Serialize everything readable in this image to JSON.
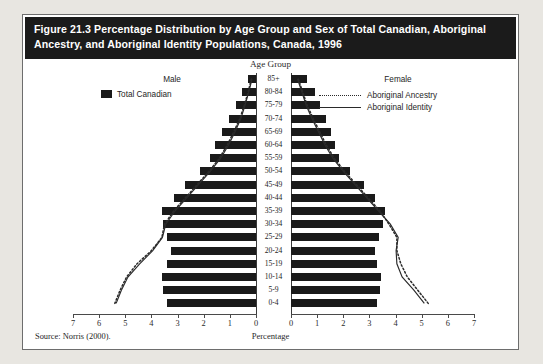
{
  "figure": {
    "title": "Figure 21.3 Percentage Distribution by Age Group and Sex of Total Canadian, Aboriginal Ancestry, and Aboriginal Identity Populations, Canada, 1996",
    "source": "Source: Norris (2000)."
  },
  "legend": {
    "male_header": "Male",
    "female_header": "Female",
    "total_canadian": "Total Canadian",
    "aboriginal_ancestry": "Aboriginal Ancestry",
    "aboriginal_identity": "Aboriginal Identity"
  },
  "axes": {
    "age_group_title": "Age Group",
    "percentage_title": "Percentage",
    "left_ticks": [
      "7",
      "6",
      "5",
      "4",
      "3",
      "2",
      "1",
      "0"
    ],
    "right_ticks": [
      "0",
      "1",
      "2",
      "3",
      "4",
      "5",
      "6",
      "7"
    ]
  },
  "colors": {
    "bar": "#1a1a1a",
    "title_bar_bg": "#1b1b1b",
    "title_text": "#ffffff",
    "page_bg": "#e8e6e1",
    "figure_bg": "#ffffff",
    "line": "#2a2a2a"
  },
  "chart_data": {
    "type": "bar",
    "title": "Figure 21.3 Percentage Distribution by Age Group and Sex of Total Canadian, Aboriginal Ancestry, and Aboriginal Identity Populations, Canada, 1996",
    "subtitle": "Population pyramid, Canada, 1996",
    "xlabel": "Percentage",
    "ylabel": "Age Group",
    "xlim": [
      0,
      7
    ],
    "grid": false,
    "legend_position": "inside-top-left-and-top-right",
    "categories": [
      "85+",
      "80-84",
      "75-79",
      "70-74",
      "65-69",
      "60-64",
      "55-59",
      "50-54",
      "45-49",
      "40-44",
      "35-39",
      "30-34",
      "25-29",
      "20-24",
      "15-19",
      "10-14",
      "5-9",
      "0-4"
    ],
    "series": [
      {
        "name": "Total Canadian - Male",
        "side": "left",
        "style": "bar",
        "values": [
          0.3,
          0.52,
          0.78,
          1.05,
          1.3,
          1.55,
          1.75,
          2.15,
          2.7,
          3.15,
          3.6,
          3.55,
          3.4,
          3.25,
          3.4,
          3.6,
          3.55,
          3.4
        ]
      },
      {
        "name": "Total Canadian - Female",
        "side": "right",
        "style": "bar",
        "values": [
          0.62,
          0.92,
          1.12,
          1.35,
          1.52,
          1.7,
          1.85,
          2.25,
          2.78,
          3.2,
          3.6,
          3.52,
          3.35,
          3.2,
          3.3,
          3.45,
          3.4,
          3.28
        ]
      },
      {
        "name": "Aboriginal Ancestry - Male",
        "side": "left",
        "style": "dotted-line",
        "values": [
          0.18,
          0.3,
          0.45,
          0.62,
          0.85,
          1.1,
          1.4,
          1.8,
          2.25,
          2.7,
          3.15,
          3.5,
          3.6,
          4.0,
          4.55,
          4.95,
          5.2,
          5.4
        ]
      },
      {
        "name": "Aboriginal Ancestry - Female",
        "side": "right",
        "style": "dotted-line",
        "values": [
          0.28,
          0.45,
          0.62,
          0.85,
          1.1,
          1.35,
          1.65,
          2.05,
          2.5,
          2.95,
          3.4,
          3.75,
          4.05,
          4.05,
          4.2,
          4.45,
          4.85,
          5.25
        ]
      },
      {
        "name": "Aboriginal Identity - Male",
        "side": "left",
        "style": "solid-line",
        "values": [
          0.15,
          0.28,
          0.42,
          0.58,
          0.8,
          1.05,
          1.35,
          1.75,
          2.2,
          2.65,
          3.1,
          3.45,
          3.58,
          3.95,
          4.45,
          4.9,
          5.15,
          5.35
        ]
      },
      {
        "name": "Aboriginal Identity - Female",
        "side": "right",
        "style": "solid-line",
        "values": [
          0.25,
          0.42,
          0.58,
          0.8,
          1.05,
          1.3,
          1.6,
          2.0,
          2.45,
          2.9,
          3.35,
          3.8,
          4.1,
          4.02,
          4.05,
          4.25,
          4.7,
          5.1
        ]
      }
    ]
  }
}
